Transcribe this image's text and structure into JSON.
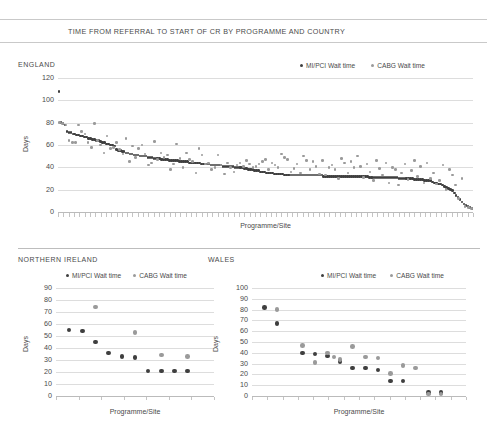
{
  "figure": {
    "title": "TIME FROM REFERRAL TO START OF CR BY PROGRAMME AND COUNTRY",
    "series_colors": {
      "mi_pci": "#3f3f3f",
      "cabg": "#9a9a9a"
    },
    "legend": {
      "mi_pci_label": "MI/PCI Wait time",
      "cabg_label": "CABG Wait time"
    },
    "axis_labels": {
      "y": "Days",
      "x": "Programme/Site"
    }
  },
  "chart_data": [
    {
      "type": "scatter",
      "title": "ENGLAND",
      "xlabel": "Programme/Site",
      "ylabel": "Days",
      "ylim": [
        0,
        120
      ],
      "yticks": [
        0,
        20,
        40,
        60,
        80,
        100,
        120
      ],
      "grid": true,
      "legend_position": "top-right",
      "series": [
        {
          "name": "MI/PCI Wait time",
          "color": "#3f3f3f",
          "values": [
            108,
            80,
            79,
            78,
            72,
            71,
            71,
            70,
            70,
            69,
            69,
            68,
            68,
            67,
            67,
            66,
            66,
            65,
            65,
            64,
            64,
            63,
            62,
            62,
            61,
            61,
            60,
            60,
            59,
            56,
            55,
            55,
            54,
            54,
            53,
            53,
            52,
            52,
            51,
            51,
            51,
            50,
            50,
            50,
            50,
            49,
            49,
            49,
            48,
            48,
            48,
            48,
            47,
            47,
            47,
            47,
            46,
            46,
            46,
            46,
            46,
            45,
            45,
            45,
            45,
            45,
            44,
            44,
            44,
            44,
            44,
            44,
            43,
            43,
            43,
            43,
            43,
            42,
            42,
            42,
            42,
            42,
            42,
            41,
            41,
            41,
            41,
            41,
            41,
            40,
            40,
            40,
            40,
            40,
            39,
            39,
            38,
            38,
            38,
            37,
            37,
            37,
            36,
            36,
            36,
            35,
            35,
            35,
            35,
            34,
            34,
            34,
            34,
            34,
            33,
            33,
            33,
            33,
            33,
            33,
            33,
            33,
            33,
            33,
            33,
            33,
            33,
            33,
            33,
            33,
            33,
            33,
            33,
            33,
            32,
            32,
            32,
            32,
            32,
            32,
            32,
            32,
            32,
            32,
            32,
            32,
            32,
            32,
            32,
            32,
            32,
            32,
            32,
            32,
            32,
            32,
            32,
            31,
            31,
            31,
            31,
            31,
            31,
            31,
            31,
            31,
            31,
            31,
            31,
            31,
            31,
            31,
            30,
            30,
            30,
            30,
            30,
            30,
            30,
            30,
            29,
            29,
            29,
            29,
            29,
            28,
            28,
            28,
            28,
            27,
            26,
            26,
            25,
            25,
            24,
            23,
            22,
            21,
            20,
            19,
            17,
            15,
            13,
            11,
            9,
            7,
            6,
            5,
            4,
            3
          ]
        },
        {
          "name": "CABG Wait time",
          "color": "#9a9a9a",
          "values": [
            80,
            79,
            78,
            64,
            62,
            62,
            78,
            72,
            70,
            62,
            58,
            79,
            64,
            60,
            53,
            68,
            57,
            58,
            62,
            56,
            52,
            66,
            45,
            59,
            49,
            57,
            60,
            52,
            42,
            44,
            63,
            47,
            53,
            49,
            51,
            38,
            43,
            61,
            48,
            40,
            53,
            47,
            45,
            35,
            57,
            51,
            43,
            44,
            38,
            40,
            51,
            42,
            34,
            44,
            40,
            36,
            42,
            44,
            41,
            46,
            43,
            40,
            41,
            43,
            45,
            47,
            38,
            44,
            42,
            40,
            52,
            49,
            47,
            36,
            39,
            43,
            35,
            50,
            46,
            38,
            45,
            41,
            34,
            46,
            33,
            40,
            42,
            38,
            30,
            48,
            44,
            35,
            45,
            40,
            50,
            41,
            31,
            43,
            36,
            28,
            46,
            39,
            33,
            44,
            26,
            40,
            38,
            24,
            35,
            43,
            29,
            37,
            46,
            32,
            41,
            26,
            44,
            30,
            35,
            25,
            28,
            42,
            20,
            38,
            33,
            24,
            12,
            30,
            5,
            4,
            3
          ]
        }
      ]
    },
    {
      "type": "scatter",
      "title": "NORTHERN IRELAND",
      "xlabel": "Programme/Site",
      "ylabel": "Days",
      "ylim": [
        0,
        90
      ],
      "yticks": [
        0,
        10,
        20,
        30,
        40,
        50,
        60,
        70,
        80,
        90
      ],
      "grid": true,
      "legend_position": "top-right",
      "series": [
        {
          "name": "MI/PCI Wait time",
          "color": "#3f3f3f",
          "x": [
            1,
            2,
            3,
            4,
            5,
            6,
            7,
            8,
            9,
            10
          ],
          "values": [
            55,
            54,
            45,
            36,
            33,
            32,
            21,
            21,
            21,
            21
          ]
        },
        {
          "name": "CABG Wait time",
          "color": "#9a9a9a",
          "x": [
            3,
            6,
            8,
            10
          ],
          "values": [
            74,
            53,
            34,
            33
          ]
        }
      ]
    },
    {
      "type": "scatter",
      "title": "WALES",
      "xlabel": "Programme/Site",
      "ylabel": "Days",
      "ylim": [
        0,
        100
      ],
      "yticks": [
        0,
        10,
        20,
        30,
        40,
        50,
        60,
        70,
        80,
        90,
        100
      ],
      "grid": true,
      "legend_position": "top-right",
      "series": [
        {
          "name": "MI/PCI Wait time",
          "color": "#3f3f3f",
          "x": [
            1,
            2,
            4,
            5,
            6,
            7,
            8,
            9,
            10,
            11,
            12,
            14,
            15
          ],
          "values": [
            82,
            67,
            40,
            39,
            37,
            32,
            26,
            26,
            24,
            14,
            14,
            3,
            3
          ]
        },
        {
          "name": "CABG Wait time",
          "color": "#9a9a9a",
          "x": [
            2,
            4,
            5,
            6,
            6.5,
            7,
            8,
            9,
            10,
            11,
            12,
            13,
            14,
            15
          ],
          "values": [
            80,
            47,
            31,
            40,
            36,
            34,
            46,
            36,
            35,
            21,
            28,
            26,
            2,
            2
          ]
        }
      ]
    }
  ]
}
